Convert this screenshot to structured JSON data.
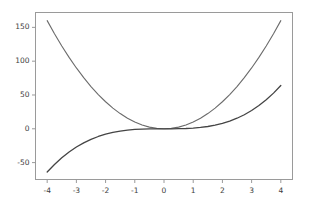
{
  "chart_data": {
    "type": "line",
    "title": "",
    "xlabel": "",
    "ylabel": "",
    "xlim": [
      -4.4,
      4.4
    ],
    "ylim": [
      -75,
      172
    ],
    "xticks": [
      -4,
      -3,
      -2,
      -1,
      0,
      1,
      2,
      3,
      4
    ],
    "yticks": [
      -50,
      0,
      50,
      100,
      150
    ],
    "xtick_labels": [
      "-4",
      "-3",
      "-2",
      "-1",
      "0",
      "1",
      "2",
      "3",
      "4"
    ],
    "ytick_labels": [
      "-50",
      "0",
      "50",
      "100",
      "150"
    ],
    "grid": false,
    "legend": null,
    "background": "#ffffff",
    "axes_color": "#9a9a9a",
    "tick_label_color": "#3d3d3d",
    "x": [
      -4,
      -3.75,
      -3.5,
      -3.25,
      -3,
      -2.75,
      -2.5,
      -2.25,
      -2,
      -1.75,
      -1.5,
      -1.25,
      -1,
      -0.75,
      -0.5,
      -0.25,
      0,
      0.25,
      0.5,
      0.75,
      1,
      1.25,
      1.5,
      1.75,
      2,
      2.25,
      2.5,
      2.75,
      3,
      3.25,
      3.5,
      3.75,
      4
    ],
    "series": [
      {
        "name": "quadratic",
        "expression": "y = 10x^2",
        "color": "#6b6b6b",
        "linewidth": 1.1,
        "values": [
          160,
          140.6,
          122.5,
          105.6,
          90,
          75.6,
          62.5,
          50.6,
          40,
          30.6,
          22.5,
          15.6,
          10,
          5.6,
          2.5,
          0.6,
          0,
          0.6,
          2.5,
          5.6,
          10,
          15.6,
          22.5,
          30.6,
          40,
          50.6,
          62.5,
          75.6,
          90,
          105.6,
          122.5,
          140.6,
          160
        ]
      },
      {
        "name": "cubic",
        "expression": "y = x^3",
        "color": "#444444",
        "linewidth": 1.3,
        "values": [
          -64,
          -52.73,
          -42.88,
          -34.33,
          -27,
          -20.8,
          -15.63,
          -11.39,
          -8,
          -5.36,
          -3.38,
          -1.95,
          -1,
          -0.42,
          -0.13,
          -0.02,
          0,
          0.02,
          0.13,
          0.42,
          1,
          1.95,
          3.38,
          5.36,
          8,
          11.39,
          15.63,
          20.8,
          27,
          34.33,
          42.88,
          52.73,
          64
        ]
      }
    ]
  }
}
